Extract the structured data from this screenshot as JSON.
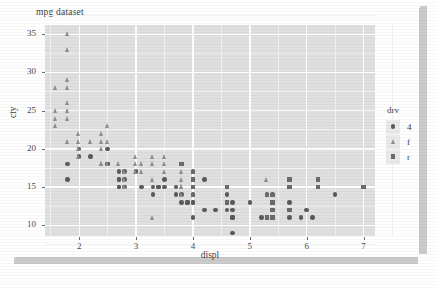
{
  "chart_data": {
    "type": "scatter",
    "title": "mpg dataset",
    "xlabel": "displ",
    "ylabel": "cty",
    "xlim": [
      1.4,
      7.2
    ],
    "ylim": [
      8.6,
      36.2
    ],
    "xticks": [
      "2",
      "3",
      "4",
      "5",
      "6",
      "7"
    ],
    "xtick_values": [
      2,
      3,
      4,
      5,
      6,
      7
    ],
    "yticks": [
      "10",
      "15",
      "20",
      "25",
      "30",
      "35"
    ],
    "ytick_values": [
      10,
      15,
      20,
      25,
      30,
      35
    ],
    "grid": true,
    "panel_background": "#e0e0e0",
    "gridline_color": "#ffffff",
    "legend": {
      "title": "drv",
      "position": "right",
      "entries": [
        {
          "label": "4",
          "shape": "circle",
          "color": "#5a5a5a"
        },
        {
          "label": "f",
          "shape": "triangle",
          "color": "#8e8e8e"
        },
        {
          "label": "r",
          "shape": "square",
          "color": "#6b6b6b"
        }
      ]
    },
    "series": [
      {
        "name": "4",
        "shape": "circle",
        "color": "#5a5a5a",
        "points": [
          [
            1.8,
            18
          ],
          [
            1.8,
            16
          ],
          [
            2.0,
            20
          ],
          [
            2.0,
            19
          ],
          [
            2.2,
            19
          ],
          [
            2.5,
            20
          ],
          [
            2.5,
            18
          ],
          [
            2.5,
            18
          ],
          [
            2.7,
            17
          ],
          [
            2.7,
            16
          ],
          [
            2.7,
            16
          ],
          [
            2.7,
            15
          ],
          [
            2.7,
            15
          ],
          [
            2.8,
            17
          ],
          [
            2.8,
            16
          ],
          [
            2.8,
            15
          ],
          [
            3.0,
            17
          ],
          [
            3.1,
            15
          ],
          [
            3.3,
            15
          ],
          [
            3.3,
            14
          ],
          [
            3.4,
            15
          ],
          [
            3.4,
            15
          ],
          [
            3.5,
            16
          ],
          [
            3.5,
            15
          ],
          [
            3.7,
            15
          ],
          [
            3.7,
            14
          ],
          [
            3.8,
            18
          ],
          [
            3.8,
            14
          ],
          [
            3.8,
            13
          ],
          [
            3.9,
            13
          ],
          [
            3.9,
            13
          ],
          [
            4.0,
            17
          ],
          [
            4.0,
            16
          ],
          [
            4.0,
            15
          ],
          [
            4.0,
            14
          ],
          [
            4.0,
            13
          ],
          [
            4.0,
            13
          ],
          [
            4.0,
            11
          ],
          [
            4.2,
            16
          ],
          [
            4.2,
            12
          ],
          [
            4.4,
            12
          ],
          [
            4.6,
            14
          ],
          [
            4.6,
            13
          ],
          [
            4.6,
            12
          ],
          [
            4.7,
            13
          ],
          [
            4.7,
            12
          ],
          [
            4.7,
            11
          ],
          [
            4.7,
            11
          ],
          [
            4.7,
            9
          ],
          [
            5.0,
            13
          ],
          [
            5.2,
            11
          ],
          [
            5.3,
            14
          ],
          [
            5.3,
            11
          ],
          [
            5.4,
            14
          ],
          [
            5.4,
            13
          ],
          [
            5.4,
            12
          ],
          [
            5.4,
            11
          ],
          [
            5.4,
            11
          ],
          [
            5.7,
            13
          ],
          [
            5.7,
            12
          ],
          [
            5.7,
            11
          ],
          [
            5.9,
            11
          ],
          [
            6.0,
            12
          ],
          [
            6.1,
            11
          ],
          [
            6.5,
            14
          ]
        ]
      },
      {
        "name": "f",
        "shape": "triangle",
        "color": "#8e8e8e",
        "points": [
          [
            1.8,
            35
          ],
          [
            1.8,
            33
          ],
          [
            1.8,
            29
          ],
          [
            1.6,
            28
          ],
          [
            1.8,
            28
          ],
          [
            1.8,
            26
          ],
          [
            1.6,
            25
          ],
          [
            1.8,
            25
          ],
          [
            1.6,
            24
          ],
          [
            1.8,
            24
          ],
          [
            1.6,
            23
          ],
          [
            2.5,
            23
          ],
          [
            2.0,
            22
          ],
          [
            2.4,
            22
          ],
          [
            1.8,
            21
          ],
          [
            2.0,
            21
          ],
          [
            2.2,
            21
          ],
          [
            2.4,
            21
          ],
          [
            2.5,
            21
          ],
          [
            2.0,
            20
          ],
          [
            2.4,
            20
          ],
          [
            2.0,
            19
          ],
          [
            3.0,
            19
          ],
          [
            3.3,
            19
          ],
          [
            3.5,
            19
          ],
          [
            2.4,
            18
          ],
          [
            2.4,
            18
          ],
          [
            2.5,
            18
          ],
          [
            2.7,
            18
          ],
          [
            3.0,
            18
          ],
          [
            3.1,
            18
          ],
          [
            3.3,
            18
          ],
          [
            3.5,
            18
          ],
          [
            2.8,
            17
          ],
          [
            3.0,
            17
          ],
          [
            3.1,
            17
          ],
          [
            3.5,
            17
          ],
          [
            3.8,
            17
          ],
          [
            2.8,
            16
          ],
          [
            3.3,
            16
          ],
          [
            3.8,
            16
          ],
          [
            2.8,
            15
          ],
          [
            3.8,
            15
          ],
          [
            3.8,
            15
          ],
          [
            3.8,
            14
          ],
          [
            3.3,
            11
          ],
          [
            5.3,
            16
          ]
        ]
      },
      {
        "name": "r",
        "shape": "square",
        "color": "#6b6b6b",
        "points": [
          [
            3.8,
            18
          ],
          [
            4.0,
            17
          ],
          [
            4.0,
            16
          ],
          [
            4.0,
            15
          ],
          [
            4.6,
            15
          ],
          [
            5.3,
            14
          ],
          [
            5.3,
            14
          ],
          [
            5.4,
            14
          ],
          [
            5.4,
            13
          ],
          [
            5.4,
            12
          ],
          [
            5.3,
            11
          ],
          [
            5.4,
            11
          ],
          [
            5.4,
            11
          ],
          [
            5.7,
            16
          ],
          [
            5.7,
            15
          ],
          [
            6.2,
            16
          ],
          [
            6.2,
            15
          ],
          [
            7.0,
            15
          ],
          [
            4.0,
            14
          ],
          [
            4.6,
            13
          ],
          [
            5.7,
            12
          ]
        ]
      }
    ]
  }
}
